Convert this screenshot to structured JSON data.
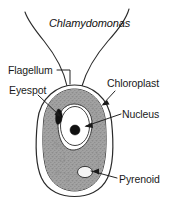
{
  "figure": {
    "title": "Chlamydomonas",
    "organism": "Chlamydomonas",
    "type": "labeled-biological-cell-diagram",
    "background_color": "#ffffff",
    "line_color": "#1a1a1a",
    "chloroplast_fill": "#9a9a9a",
    "cytoplasm_fill": "#ffffff",
    "eyespot_fill": "#111111",
    "nucleolus_fill": "#111111",
    "pyrenoid_fill": "#f2f2f2"
  },
  "labels": [
    {
      "id": "flagellum",
      "text": "Flagellum",
      "side": "left"
    },
    {
      "id": "eyespot",
      "text": "Eyespot",
      "side": "left"
    },
    {
      "id": "chloroplast",
      "text": "Chloroplast",
      "side": "right"
    },
    {
      "id": "nucleus",
      "text": "Nucleus",
      "side": "right"
    },
    {
      "id": "pyrenoid",
      "text": "Pyrenoid",
      "side": "right"
    }
  ],
  "structures": {
    "cell_wall": "cell-wall-outline",
    "chloroplast": "cup-shaped-chloroplast",
    "nucleus": "nucleus-oval",
    "nucleolus": "nucleolus-dot",
    "eyespot": "eyespot-stigma",
    "pyrenoid": "pyrenoid-body",
    "flagella_count": 2
  }
}
